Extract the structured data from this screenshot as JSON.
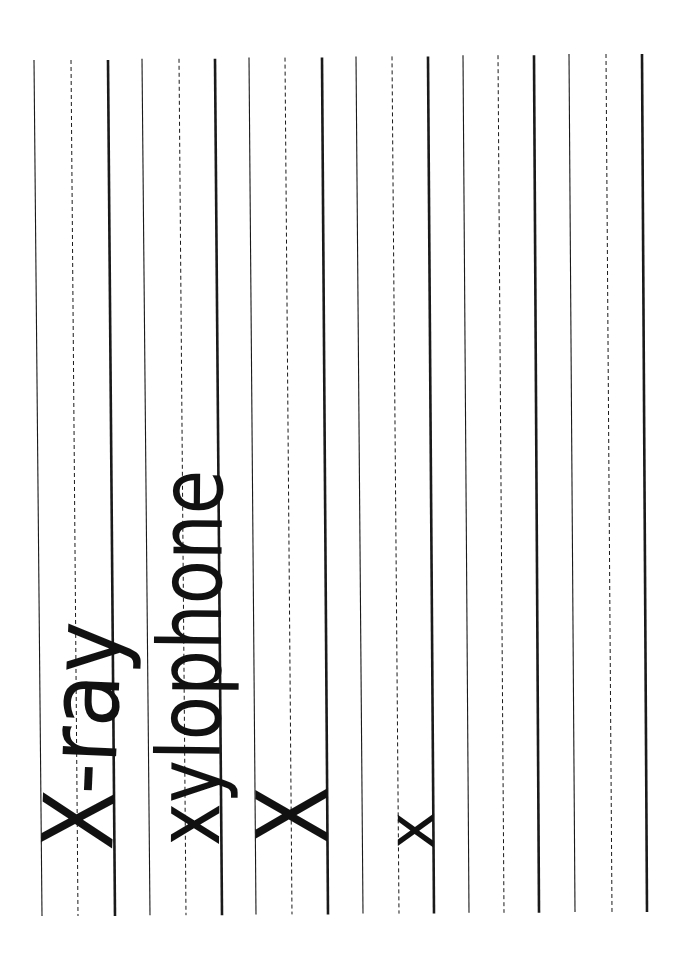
{
  "worksheet": {
    "type": "handwriting practice sheet (rotated 90°)",
    "line_color": "#1a1a1a",
    "text_color": "#111111",
    "background": "#ffffff",
    "rows": [
      {
        "top_line_x": [
          34,
          42
        ],
        "mid_line_x": [
          71,
          78
        ],
        "base_line_x": [
          108,
          115
        ],
        "word": "X-ray"
      },
      {
        "top_line_x": [
          142,
          150
        ],
        "mid_line_x": [
          179,
          186
        ],
        "base_line_x": [
          215,
          222
        ],
        "word": "xylophone"
      },
      {
        "top_line_x": [
          249,
          256
        ],
        "mid_line_x": [
          285,
          292
        ],
        "base_line_x": [
          322,
          328
        ],
        "word": "X"
      },
      {
        "top_line_x": [
          356,
          363
        ],
        "mid_line_x": [
          392,
          399
        ],
        "base_line_x": [
          428,
          434
        ],
        "word": "x"
      },
      {
        "top_line_x": [
          463,
          469
        ],
        "mid_line_x": [
          498,
          504
        ],
        "base_line_x": [
          534,
          539
        ],
        "word": ""
      },
      {
        "top_line_x": [
          569,
          575
        ],
        "mid_line_x": [
          606,
          612
        ],
        "base_line_x": [
          642,
          647
        ],
        "word": ""
      }
    ]
  },
  "words": {
    "w1": "X-ray",
    "w2": "xylophone",
    "w3": "X",
    "w4": "x"
  }
}
